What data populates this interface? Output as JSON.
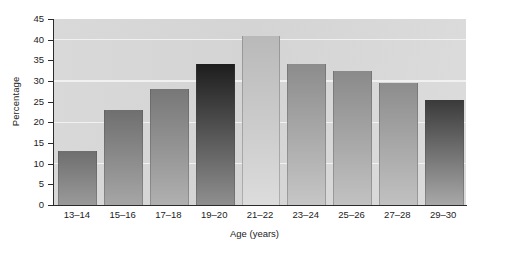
{
  "chart_data": {
    "type": "bar",
    "title": "",
    "subtitle": "",
    "xlabel": "Age (years)",
    "ylabel": "Percentage",
    "categories": [
      "13–14",
      "15–16",
      "17–18",
      "19–20",
      "21–22",
      "23–24",
      "25–26",
      "27–28",
      "29–30"
    ],
    "values": [
      13,
      23,
      28,
      34,
      41,
      34,
      32.5,
      29.5,
      25.5
    ],
    "ylim": [
      0,
      45
    ],
    "ytick_values": [
      0,
      5,
      10,
      15,
      20,
      25,
      30,
      35,
      40,
      45
    ],
    "ytick_labels": [
      "0",
      "5",
      "10",
      "15",
      "20",
      "25",
      "30",
      "35",
      "40",
      "45"
    ],
    "gridlines_at": [
      10,
      20,
      30,
      40
    ],
    "grid": true,
    "grid_color": "#f2f2f2",
    "legend": null,
    "legend_position": "none",
    "plot_background": "#d6d6d6",
    "axis_color": "#2b2b2b",
    "bar_gradient_top": [
      "#6e6e6e",
      "#6f6f6f",
      "#777777",
      "#1d1d1d",
      "#b9b9b9",
      "#8c8c8c",
      "#8a8a8a",
      "#8d8d8d",
      "#3a3a3a"
    ],
    "bar_gradient_bottom": [
      "#9a9a9a",
      "#a6a6a6",
      "#b0b0b0",
      "#8f8f8f",
      "#dcdcdc",
      "#c6c6c6",
      "#c2c2c2",
      "#c1c1c1",
      "#a8a8a8"
    ]
  },
  "caption_fragment": ""
}
